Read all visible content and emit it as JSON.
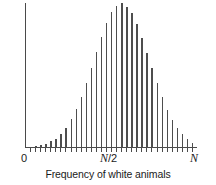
{
  "figure": {
    "background_color": "#ffffff",
    "axis_color": "#4a4a4a",
    "bar_color": "#4e4e4e",
    "text_color": "#1a1a1a"
  },
  "axes": {
    "ylabel": "Probability",
    "xlabel": "Frequency of white animals",
    "xticklabels": {
      "left": "0",
      "middle_prefix": "N",
      "middle_suffix": "/2",
      "right": "N"
    }
  },
  "chart_data": {
    "type": "bar",
    "title": "",
    "subtitle": "",
    "xlabel": "Frequency of white animals",
    "ylabel": "Probability",
    "grid": false,
    "legend": null,
    "annotations": [],
    "xlim": [
      0,
      32
    ],
    "ylim": [
      0,
      1.0
    ],
    "xtick_positions": [
      0,
      16,
      32
    ],
    "xtick_labels": [
      "0",
      "N/2",
      "N"
    ],
    "ytick_labels": [],
    "categories": [
      0,
      1,
      2,
      3,
      4,
      5,
      6,
      7,
      8,
      9,
      10,
      11,
      12,
      13,
      14,
      15,
      16,
      17,
      18,
      19,
      20,
      21,
      22,
      23,
      24,
      25,
      26,
      27,
      28,
      29,
      30,
      31,
      32
    ],
    "values": [
      0.01,
      0.015,
      0.02,
      0.03,
      0.045,
      0.065,
      0.1,
      0.14,
      0.2,
      0.27,
      0.355,
      0.45,
      0.555,
      0.66,
      0.765,
      0.86,
      0.935,
      0.98,
      1.0,
      0.975,
      0.93,
      0.855,
      0.76,
      0.655,
      0.55,
      0.445,
      0.35,
      0.265,
      0.195,
      0.14,
      0.095,
      0.06,
      0.035
    ]
  }
}
